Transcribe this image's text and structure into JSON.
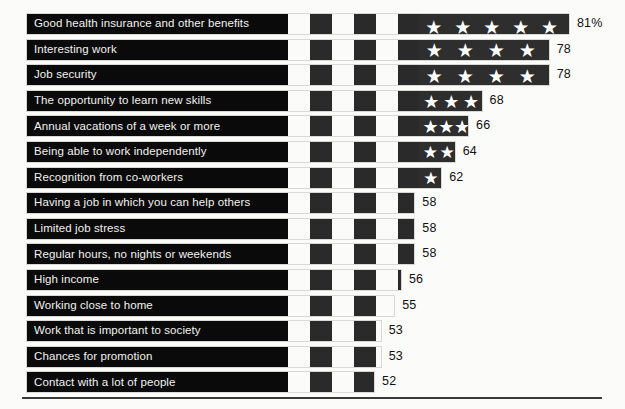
{
  "chart_data": {
    "type": "bar",
    "title": "",
    "subtitle": "",
    "xlabel": "",
    "ylabel": "",
    "orientation": "horizontal",
    "grid": false,
    "legend": false,
    "value_suffix_first": "%",
    "xlim": [
      0,
      81
    ],
    "categories": [
      "Good health insurance and other benefits",
      "Interesting work",
      "Job security",
      "The opportunity to learn new skills",
      "Annual vacations of a week or more",
      "Being able to work independently",
      "Recognition from co-workers",
      "Having a job in which you can help others",
      "Limited job stress",
      "Regular hours, no nights or weekends",
      "High income",
      "Working close to home",
      "Work that is important to society",
      "Chances for promotion",
      "Contact with a lot of people"
    ],
    "values": [
      81,
      78,
      78,
      68,
      66,
      64,
      62,
      58,
      58,
      58,
      56,
      55,
      53,
      53,
      52
    ],
    "value_labels": [
      "81%",
      "78",
      "78",
      "68",
      "66",
      "64",
      "62",
      "58",
      "58",
      "58",
      "56",
      "55",
      "53",
      "53",
      "52"
    ],
    "stars_per_row": [
      5,
      4,
      4,
      3,
      3,
      2,
      1,
      0,
      0,
      0,
      0,
      0,
      0,
      0,
      0
    ],
    "colors": {
      "bar_dark": "#0a0a0a",
      "stripe_light": "#fbfbfa",
      "stripe_dark": "#2a2a2a",
      "canton": "#2e2e2e",
      "star": "#ffffff",
      "label_text": "#f2f2f0",
      "value_text": "#111111",
      "background": "#fbfbfa",
      "rule": "#3a3a3a",
      "bar_border": "#d8d8d6"
    }
  },
  "icons": {
    "star": "★"
  }
}
